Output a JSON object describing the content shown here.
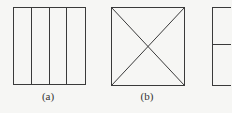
{
  "figure": {
    "background": "#f6f6f4",
    "line_color": "#3a3a3a",
    "panels": [
      {
        "id": "a",
        "label": "(a)",
        "description": "square divided into four vertical strips",
        "box": {
          "x": 13,
          "y": 7,
          "w": 72,
          "h": 77
        },
        "vertical_dividers": 3,
        "label_pos": {
          "x": 48,
          "y": 92
        }
      },
      {
        "id": "b",
        "label": "(b)",
        "description": "square with both diagonals drawn",
        "box": {
          "x": 111,
          "y": 7,
          "w": 73,
          "h": 78
        },
        "diagonals": true,
        "label_pos": {
          "x": 147,
          "y": 92
        }
      },
      {
        "id": "c",
        "label": "",
        "description": "square divided by a horizontal line (partially cropped)",
        "box": {
          "x": 212,
          "y": 7,
          "w": 73,
          "h": 78
        },
        "horizontal_divider_y": 44
      }
    ]
  }
}
